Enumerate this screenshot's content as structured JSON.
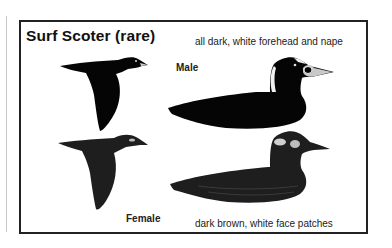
{
  "title": "Surf Scoter (rare)",
  "male": {
    "label": "Male",
    "description": "all dark, white forehead and nape"
  },
  "female": {
    "label": "Female",
    "description": "dark brown, white face patches"
  },
  "illustrations": [
    {
      "name": "male-flying",
      "icon": "bird-flying-illustration"
    },
    {
      "name": "male-swimming",
      "icon": "bird-swimming-illustration"
    },
    {
      "name": "female-flying",
      "icon": "bird-flying-illustration"
    },
    {
      "name": "female-swimming",
      "icon": "bird-swimming-illustration"
    }
  ],
  "colors": {
    "male_plumage": "#050505",
    "female_plumage": "#1e1e1e",
    "frame_border": "#222222"
  }
}
